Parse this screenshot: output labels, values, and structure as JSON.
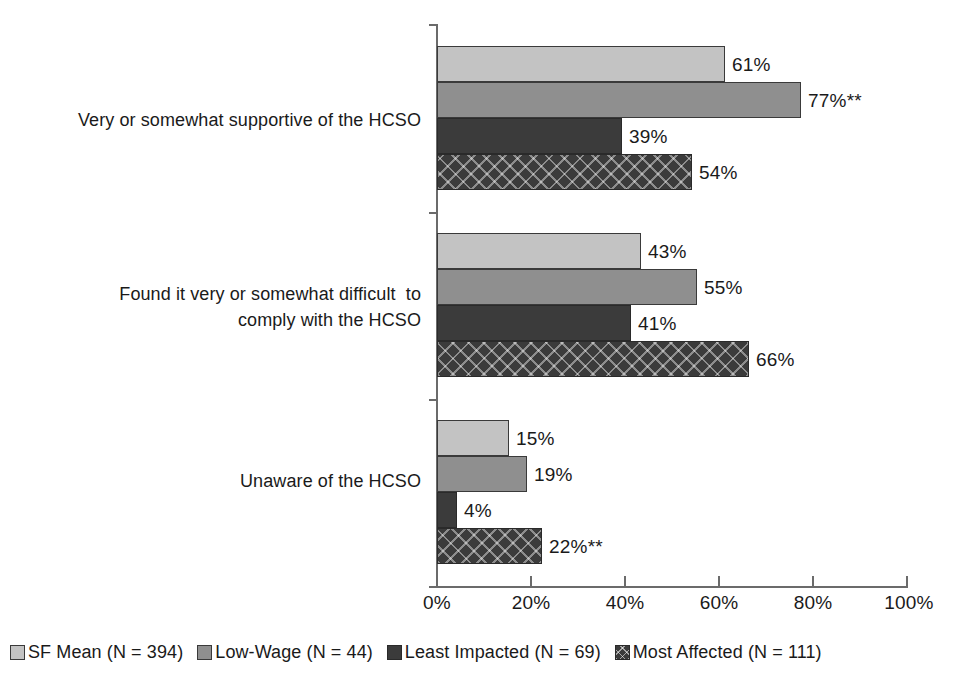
{
  "chart_data": {
    "type": "bar",
    "orientation": "horizontal",
    "title": "",
    "subtitle": "",
    "xlabel": "",
    "ylabel": "",
    "xlim": [
      0,
      100
    ],
    "xticks": [
      "0%",
      "20%",
      "40%",
      "60%",
      "80%",
      "100%"
    ],
    "xtick_values": [
      0,
      20,
      40,
      60,
      80,
      100
    ],
    "grid": false,
    "legend_position": "bottom-left",
    "categories": [
      "Very or somewhat supportive of the HCSO",
      "Found it very or somewhat difficult  to\ncomply with the HCSO",
      "Unaware of the HCSO"
    ],
    "series": [
      {
        "name": "SF Mean (N = 394)",
        "swatch": "light-gray-solid",
        "color": "#c3c3c3",
        "values": [
          61,
          43,
          15
        ],
        "labels": [
          "61%",
          "43%",
          "15%"
        ]
      },
      {
        "name": "Low-Wage (N = 44)",
        "swatch": "medium-gray-solid",
        "color": "#8f8f8f",
        "values": [
          77,
          55,
          19
        ],
        "labels": [
          "77%**",
          "55%",
          "19%"
        ]
      },
      {
        "name": "Least Impacted (N = 69)",
        "swatch": "dark-gray-solid",
        "color": "#3b3b3b",
        "values": [
          39,
          41,
          4
        ],
        "labels": [
          "39%",
          "41%",
          "4%"
        ]
      },
      {
        "name": "Most Affected (N = 111)",
        "swatch": "dark-gray-crosshatch",
        "color": "#3b3b3b",
        "values": [
          54,
          66,
          22
        ],
        "labels": [
          "54%",
          "66%",
          "22%**"
        ]
      }
    ],
    "annotations": [
      "** denotes statistical significance"
    ]
  }
}
